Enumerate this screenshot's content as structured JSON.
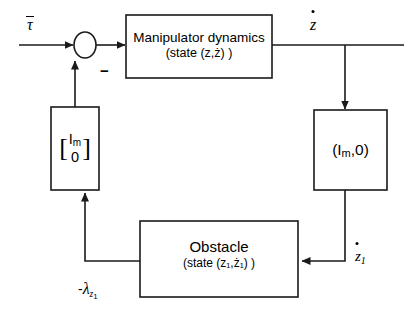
{
  "diagram": {
    "background_color": "#ffffff",
    "line_color": "#1a1a1a",
    "text_color": "#000000",
    "blocks": {
      "manipulator": {
        "line1": "Manipulator dynamics",
        "line2": "(state (z,ż) )"
      },
      "selector_column": {
        "bracket_open": "[",
        "row1": "I",
        "row1_sub": "m",
        "row2": "0",
        "bracket_close": "]"
      },
      "selector_row": {
        "text_open": "(I",
        "text_sub": "m",
        "text_close": ",0)"
      },
      "obstacle": {
        "line1": "Obstacle",
        "line2": "(state (z₁,ż₁) )"
      }
    },
    "signals": {
      "input_torque": "τ",
      "input_torque_bar": true,
      "sum_minus_sign": "−",
      "velocity": "z",
      "velocity_dot": true,
      "contact_velocity": "z",
      "contact_velocity_sub": "1",
      "contact_velocity_dot": true,
      "force_feedback_minus": "-",
      "force_feedback_symbol": "λ",
      "force_feedback_sub": "z",
      "force_feedback_sub2": "1"
    }
  }
}
